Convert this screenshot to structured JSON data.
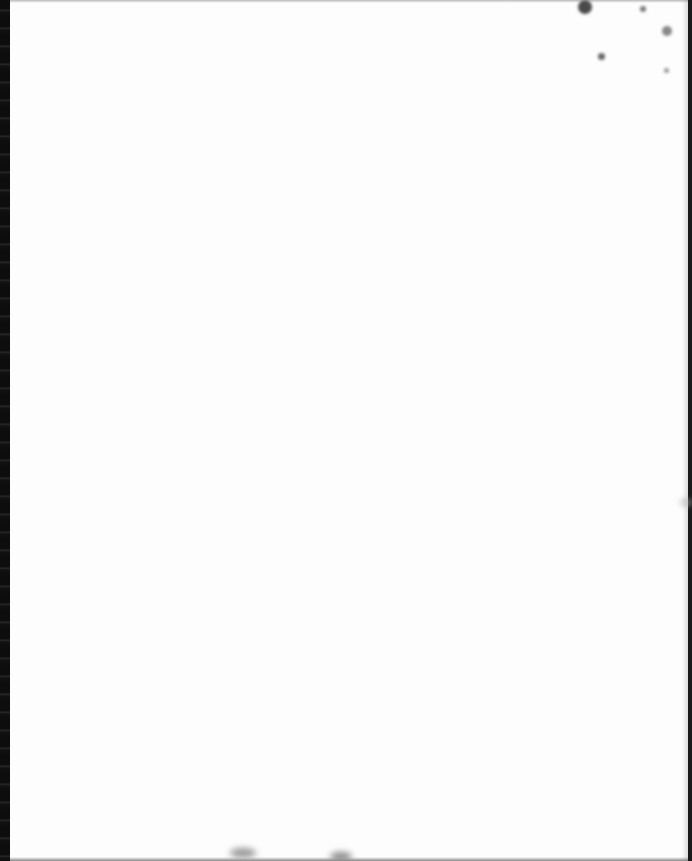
{
  "document": {
    "type": "blank-scanned-page",
    "text_content": "",
    "page_color": "#fdfdfd",
    "scan_edge_color": "#0d0d0d"
  },
  "artifacts": [
    {
      "name": "speck-top-right-1",
      "x": 578,
      "y": 0,
      "size": 14,
      "color": "#4a4a4a"
    },
    {
      "name": "speck-top-right-2",
      "x": 598,
      "y": 53,
      "size": 7,
      "color": "#666666"
    },
    {
      "name": "speck-top-right-3",
      "x": 662,
      "y": 26,
      "size": 10,
      "color": "#888888"
    },
    {
      "name": "speck-top-right-4",
      "x": 664,
      "y": 68,
      "size": 5,
      "color": "#999999"
    },
    {
      "name": "speck-top-right-5",
      "x": 640,
      "y": 6,
      "size": 6,
      "color": "#777777"
    },
    {
      "name": "smudge-right-edge",
      "x": 680,
      "y": 500,
      "size": 12,
      "color": "#b0b0b0"
    },
    {
      "name": "smudge-bottom-1",
      "x": 230,
      "y": 848,
      "size": 26,
      "color": "#9a9a9a"
    },
    {
      "name": "smudge-bottom-2",
      "x": 330,
      "y": 852,
      "size": 22,
      "color": "#8a8a8a"
    }
  ]
}
